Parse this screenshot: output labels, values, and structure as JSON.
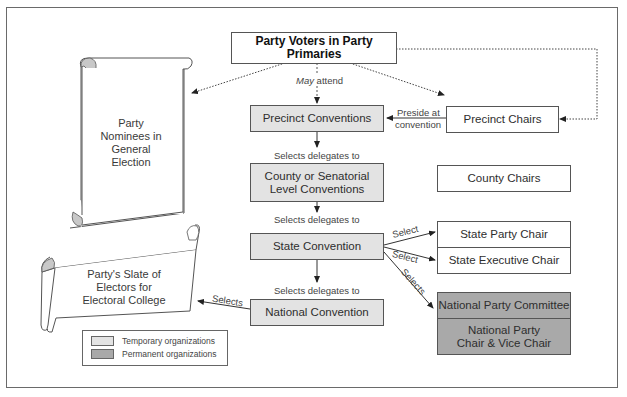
{
  "diagram": {
    "top": {
      "label": "Party Voters in Party Primaries"
    },
    "center_column": [
      {
        "id": "precinct-conventions",
        "label": "Precinct Conventions",
        "type": "temporary"
      },
      {
        "id": "county-conventions",
        "label": "County or Senatorial Level Conventions",
        "type": "temporary"
      },
      {
        "id": "state-convention",
        "label": "State Convention",
        "type": "temporary"
      },
      {
        "id": "national-convention",
        "label": "National Convention",
        "type": "temporary"
      }
    ],
    "right_column": [
      {
        "id": "precinct-chairs",
        "label": "Precinct Chairs"
      },
      {
        "id": "county-chairs",
        "label": "County Chairs"
      },
      {
        "id": "state-party-chair",
        "label": "State Party Chair"
      },
      {
        "id": "state-executive-chair",
        "label": "State Executive Chair"
      },
      {
        "id": "national-party-committee",
        "label": "National Party Committee",
        "type": "permanent"
      },
      {
        "id": "national-party-chair",
        "label": "National Party Chair & Vice Chair",
        "type": "permanent"
      }
    ],
    "scrolls": [
      {
        "id": "party-nominees",
        "label": "Party Nominees in General Election"
      },
      {
        "id": "electors-slate",
        "label": "Party's Slate of Electors for Electoral College"
      }
    ],
    "edge_labels": {
      "may_attend_italic": "May",
      "may_attend_rest": " attend",
      "preside_line1": "Preside at",
      "preside_line2": "convention",
      "selects_delegates_1": "Selects delegates to",
      "selects_delegates_2": "Selects delegates to",
      "selects_delegates_3": "Selects delegates to",
      "select_state_party": "Select",
      "select_state_exec": "Select",
      "selects_national": "Selects",
      "selects_electors": "Selects"
    },
    "legend": {
      "temporary": "Temporary organizations",
      "permanent": "Permanent organizations"
    },
    "colors": {
      "temporary": "#e3e3e3",
      "permanent": "#a9a9a9",
      "border": "#555555"
    }
  }
}
